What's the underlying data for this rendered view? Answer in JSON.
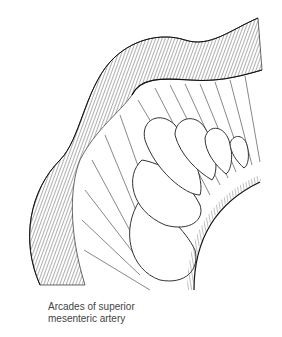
{
  "figure": {
    "caption_lines": [
      "Arcades of superior",
      "mesenteric artery"
    ],
    "colors": {
      "ink": "#222222",
      "background": "#ffffff",
      "caption": "#444444"
    }
  }
}
